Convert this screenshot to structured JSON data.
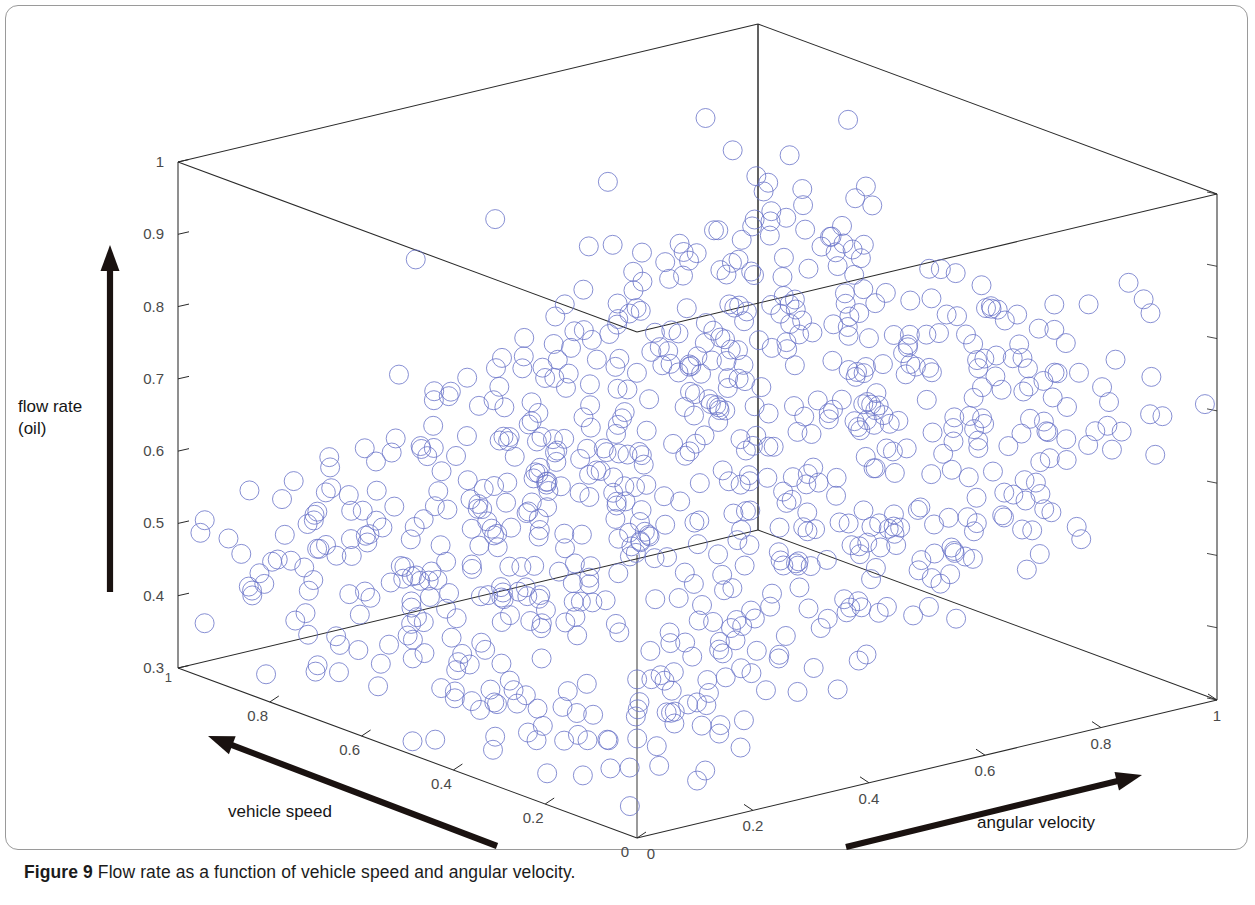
{
  "figure": {
    "caption_label": "Figure 9",
    "caption_text": "Flow rate as a function of vehicle speed and angular velocity.",
    "background": "#ffffff",
    "frame_color": "#9a9a9a",
    "axis_color": "#2a2a2a",
    "tick_label_color": "#4a4a4a",
    "marker_color": "#6a74c8",
    "arrow_color": "#1a1210"
  },
  "axes": {
    "z_title": "flow rate\n(oil)",
    "x_title": "vehicle speed",
    "y_title": "angular velocity",
    "z_ticks": [
      "0.3",
      "0.4",
      "0.5",
      "0.6",
      "0.7",
      "0.8",
      "0.9",
      "1"
    ],
    "z_values": [
      0.3,
      0.4,
      0.5,
      0.6,
      0.7,
      0.8,
      0.9,
      1.0
    ],
    "x_ticks": [
      "1",
      "0.8",
      "0.6",
      "0.4",
      "0.2",
      "0"
    ],
    "x_values": [
      1,
      0.8,
      0.6,
      0.4,
      0.2,
      0
    ],
    "y_ticks": [
      "0",
      "0.2",
      "0.4",
      "0.6",
      "0.8",
      "1"
    ],
    "y_values": [
      0,
      0.2,
      0.4,
      0.6,
      0.8,
      1
    ],
    "x_range": [
      0,
      1
    ],
    "y_range": [
      0,
      1
    ],
    "z_range": [
      0.3,
      1
    ]
  },
  "chart_data": {
    "type": "scatter",
    "title": "",
    "subtitle": "",
    "xlabel": "vehicle speed",
    "ylabel": "angular velocity",
    "zlabel": "flow rate (oil)",
    "xlim": [
      0,
      1
    ],
    "ylim": [
      0,
      1
    ],
    "zlim": [
      0.3,
      1
    ],
    "grid": false,
    "legend": "none",
    "projection": "3d",
    "marker": "open-circle",
    "marker_color": "#6a74c8",
    "marker_size_px": 19,
    "n_points": 780,
    "model": {
      "z_base": 0.36,
      "z_per_angular_velocity": 0.36,
      "z_per_vehicle_speed": 0.055,
      "noise_sigma": 0.052,
      "outlier_fraction": 0.035,
      "outlier_offset": 0.17
    },
    "series": [
      {
        "name": "flow rate (oil)",
        "color": "#6a74c8",
        "points_summary": [
          {
            "angular_velocity": 0.0,
            "flow_rate_mean": 0.4,
            "flow_rate_spread": 0.06
          },
          {
            "angular_velocity": 0.2,
            "flow_rate_mean": 0.46,
            "flow_rate_spread": 0.07
          },
          {
            "angular_velocity": 0.4,
            "flow_rate_mean": 0.53,
            "flow_rate_spread": 0.08
          },
          {
            "angular_velocity": 0.6,
            "flow_rate_mean": 0.6,
            "flow_rate_spread": 0.09
          },
          {
            "angular_velocity": 0.8,
            "flow_rate_mean": 0.68,
            "flow_rate_spread": 0.1
          },
          {
            "angular_velocity": 1.0,
            "flow_rate_mean": 0.76,
            "flow_rate_spread": 0.11
          }
        ]
      }
    ]
  },
  "geometry": {
    "origin": [
      637,
      838
    ],
    "corner_x1": [
      178,
      668
    ],
    "corner_y1": [
      1217,
      700
    ],
    "corner_back": [
      750,
      555
    ],
    "z_height_px": 506,
    "ytop_left": [
      165,
      162
    ],
    "ytop_back": [
      750,
      22
    ],
    "ytop_right": [
      1212,
      195
    ]
  },
  "arrows": {
    "z_arrow": {
      "from": [
        110,
        592
      ],
      "to": [
        110,
        245
      ]
    },
    "x_arrow": {
      "from": [
        497,
        846
      ],
      "to": [
        208,
        736
      ]
    },
    "y_arrow": {
      "from": [
        846,
        847
      ],
      "to": [
        1142,
        775
      ]
    }
  }
}
